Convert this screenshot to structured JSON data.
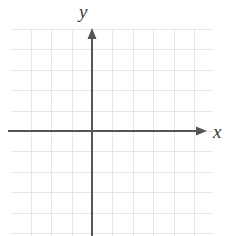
{
  "figure": {
    "kind": "cartesian-coordinate-plane",
    "background_color": "#ffffff",
    "width": 232,
    "height": 236
  },
  "grid": {
    "line_color": "#e6e6e6",
    "line_width": 1,
    "cell_size": 20.4,
    "left": 11,
    "top": 29,
    "right": 213,
    "bottom": 236,
    "columns": 10,
    "rows": 10,
    "visible": true
  },
  "axes": {
    "color": "#555555",
    "line_width": 2,
    "origin_x": 92,
    "origin_y": 131,
    "x_axis": {
      "label": "x",
      "start_x": 8,
      "end_x": 207,
      "y": 131,
      "arrow": "right-arrowhead-icon",
      "arrow_size": 9
    },
    "y_axis": {
      "label": "y",
      "start_y": 28,
      "end_y": 236,
      "x": 92,
      "arrow": "up-arrowhead-icon",
      "arrow_size": 9
    }
  },
  "chart_data": {
    "type": "scatter",
    "title": "",
    "xlabel": "x",
    "ylabel": "y",
    "x": [],
    "y": [],
    "series": [],
    "annotations": [],
    "xlim": [
      -4,
      6
    ],
    "ylim": [
      -5,
      5
    ],
    "grid": true,
    "legend": "none",
    "tick_labels": {
      "x": [],
      "y": []
    }
  }
}
